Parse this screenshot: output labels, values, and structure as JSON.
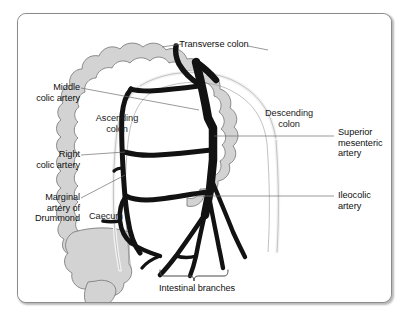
{
  "figure": {
    "background_color": "#ffffff",
    "frame_border_color": "#8b8b8b",
    "colon_fill_color": "#d3d3d3",
    "colon_outline_color": "#7a7a7a",
    "colon_lumen_color": "#efefef",
    "artery_color": "#121212",
    "leader_line_color": "#6e6e6e",
    "text_color": "#101010"
  },
  "labels": {
    "transverse_colon": "Transverse colon",
    "middle_colic_artery": "Middle\ncolic artery",
    "ascending_colon": "Ascending\ncolon",
    "descending_colon": "Descending\ncolon",
    "superior_mesenteric_artery": "Superior\nmesenteric\nartery",
    "right_colic_artery": "Right\ncolic artery",
    "ileocolic_artery": "Ileocolic\nartery",
    "marginal_artery_of_drummond": "Marginal\nartery of\nDrummond",
    "caecum": "Caecum",
    "intestinal_branches": "Intestinal branches"
  },
  "structures": [
    {
      "name": "transverse-colon",
      "kind": "organ",
      "label": "Transverse colon"
    },
    {
      "name": "ascending-colon",
      "kind": "organ",
      "label": "Ascending colon"
    },
    {
      "name": "descending-colon",
      "kind": "organ",
      "label": "Descending colon"
    },
    {
      "name": "caecum",
      "kind": "organ",
      "label": "Caecum"
    },
    {
      "name": "middle-colic-artery",
      "kind": "artery",
      "label": "Middle colic artery"
    },
    {
      "name": "right-colic-artery",
      "kind": "artery",
      "label": "Right colic artery"
    },
    {
      "name": "ileocolic-artery",
      "kind": "artery",
      "label": "Ileocolic artery"
    },
    {
      "name": "superior-mesenteric-artery",
      "kind": "artery",
      "label": "Superior mesenteric artery"
    },
    {
      "name": "marginal-artery-of-drummond",
      "kind": "artery",
      "label": "Marginal artery of Drummond"
    },
    {
      "name": "intestinal-branches",
      "kind": "artery",
      "label": "Intestinal branches"
    }
  ]
}
